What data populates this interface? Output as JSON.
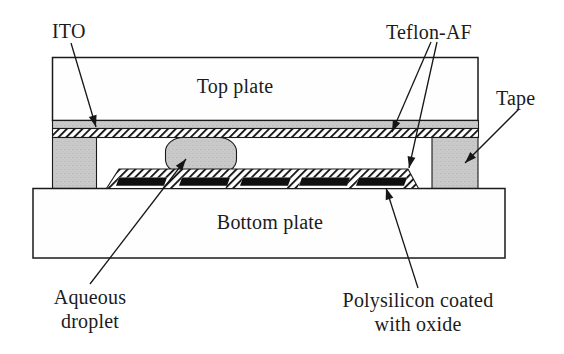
{
  "figure": {
    "labels": {
      "ito": "ITO",
      "teflon_af": "Teflon-AF",
      "tape": "Tape",
      "top_plate": "Top plate",
      "bottom_plate": "Bottom plate",
      "aqueous_droplet": "Aqueous droplet",
      "polysilicon": "Polysilicon coated with oxide"
    },
    "electrode_count": 5,
    "colors": {
      "outline": "#1a1a1a",
      "gray_fill": "#c9c9c9",
      "electrode_fill": "#101010",
      "hatch_line": "#1a1a1a",
      "background": "#ffffff"
    }
  }
}
